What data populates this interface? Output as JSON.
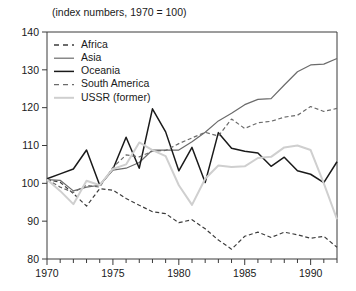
{
  "subtitle": "(index numbers, 1970 = 100)",
  "legend": {
    "position": "top-left-inside",
    "entries": [
      {
        "label": "Africa",
        "style": "dashed",
        "color": "#3c3c3c",
        "width": 1.4
      },
      {
        "label": "Asia",
        "style": "solid",
        "color": "#6b6b6b",
        "width": 1.2
      },
      {
        "label": "Oceania",
        "style": "solid",
        "color": "#1a1a1a",
        "width": 1.5
      },
      {
        "label": "South America",
        "style": "dashed",
        "color": "#6b6b6b",
        "width": 1.4
      },
      {
        "label": "USSR (former)",
        "style": "solid",
        "color": "#cfcfcf",
        "width": 2.0
      }
    ]
  },
  "axes": {
    "y_ticks": [
      "80",
      "90",
      "100",
      "110",
      "120",
      "130",
      "140"
    ],
    "x_ticks": [
      "1970",
      "1975",
      "1980",
      "1985",
      "1990"
    ],
    "ylim": [
      80,
      140
    ],
    "xlim": [
      1970,
      1992
    ],
    "grid": false
  },
  "chart_data": {
    "type": "line",
    "title": "",
    "subtitle": "(index numbers, 1970 = 100)",
    "xlabel": "",
    "ylabel": "",
    "xlim": [
      1970,
      1992
    ],
    "ylim": [
      80,
      140
    ],
    "grid": false,
    "legend_position": "upper left (inside axes)",
    "x": [
      1970,
      1971,
      1972,
      1973,
      1974,
      1975,
      1976,
      1977,
      1978,
      1979,
      1980,
      1981,
      1982,
      1983,
      1984,
      1985,
      1986,
      1987,
      1988,
      1989,
      1990,
      1991,
      1992
    ],
    "series": [
      {
        "name": "Africa",
        "style": "dashed",
        "color": "#3c3c3c",
        "values": [
          101.0,
          100.3,
          97.3,
          94.0,
          98.6,
          98.2,
          96.0,
          94.2,
          92.5,
          92.0,
          89.6,
          90.4,
          88.0,
          85.0,
          82.6,
          86.0,
          87.1,
          85.7,
          87.1,
          86.4,
          85.5,
          86.0,
          83.1
        ]
      },
      {
        "name": "Asia",
        "style": "solid",
        "color": "#6b6b6b",
        "values": [
          101.0,
          100.8,
          98.0,
          99.0,
          99.5,
          103.5,
          104.0,
          105.5,
          108.8,
          108.8,
          108.8,
          111.0,
          113.5,
          116.5,
          118.5,
          120.8,
          122.2,
          122.4,
          126.0,
          129.5,
          131.3,
          131.5,
          133.0
        ]
      },
      {
        "name": "Oceania",
        "style": "solid",
        "color": "#1a1a1a",
        "values": [
          101.2,
          102.5,
          103.8,
          108.8,
          99.5,
          103.7,
          112.2,
          104.0,
          119.7,
          113.6,
          103.3,
          109.5,
          100.2,
          113.4,
          109.3,
          108.5,
          108.0,
          104.5,
          106.9,
          103.3,
          102.4,
          100.2,
          105.7
        ]
      },
      {
        "name": "South America",
        "style": "dashed",
        "color": "#6b6b6b",
        "values": [
          101.0,
          99.0,
          97.6,
          99.5,
          99.0,
          104.2,
          107.5,
          107.0,
          108.5,
          108.7,
          110.5,
          112.0,
          113.5,
          112.5,
          117.0,
          114.5,
          116.0,
          116.4,
          117.5,
          118.0,
          120.3,
          119.0,
          119.8
        ]
      },
      {
        "name": "USSR (former)",
        "style": "solid",
        "color": "#cfcfcf",
        "values": [
          101.0,
          98.0,
          94.5,
          100.7,
          99.5,
          103.8,
          105.0,
          110.8,
          108.8,
          107.2,
          99.5,
          94.3,
          101.2,
          104.7,
          104.3,
          104.5,
          106.7,
          107.0,
          109.5,
          110.0,
          108.8,
          100.0,
          90.5
        ]
      }
    ]
  }
}
